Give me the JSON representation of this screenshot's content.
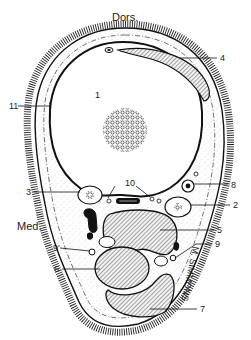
{
  "diagram": {
    "type": "anatomical-cross-section",
    "orientation": {
      "dorsal": "Dors.",
      "medial": "Med."
    },
    "labels": [
      {
        "id": "1",
        "text": "1",
        "x": 95,
        "y": 98
      },
      {
        "id": "2",
        "text": "2",
        "x": 233,
        "y": 208
      },
      {
        "id": "3",
        "text": "3",
        "x": 26,
        "y": 195
      },
      {
        "id": "4",
        "text": "4",
        "x": 220,
        "y": 61
      },
      {
        "id": "5",
        "text": "5",
        "x": 217,
        "y": 233
      },
      {
        "id": "6",
        "text": "6",
        "x": 54,
        "y": 272
      },
      {
        "id": "7",
        "text": "7",
        "x": 200,
        "y": 312
      },
      {
        "id": "8",
        "text": "8",
        "x": 231,
        "y": 188
      },
      {
        "id": "9",
        "text": "9",
        "x": 215,
        "y": 252
      },
      {
        "id": "9prime",
        "text": "9'",
        "x": 55,
        "y": 251
      },
      {
        "id": "10",
        "text": "10",
        "x": 125,
        "y": 186
      },
      {
        "id": "11",
        "text": "11",
        "x": 11,
        "y": 106
      }
    ],
    "signature": "M. SIMMONS",
    "colors": {
      "ink": "#1a1a1a",
      "background": "#ffffff",
      "hatch": "#555555"
    }
  }
}
